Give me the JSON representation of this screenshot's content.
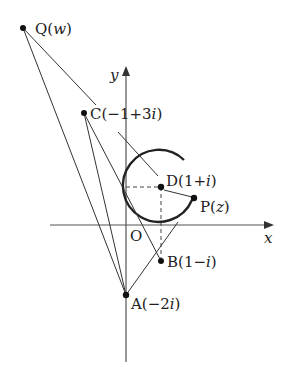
{
  "diagram": {
    "type": "complex-plane-geometry",
    "axes": {
      "x_label": "x",
      "y_label": "y",
      "origin_label": "O"
    },
    "points": {
      "Q": {
        "name": "Q",
        "arg": "w",
        "label_open": "Q(",
        "label_var": "w",
        "label_close": ")"
      },
      "C": {
        "name": "C",
        "label_open": "C(−1+3",
        "label_var": "i",
        "label_close": ")",
        "value": "-1+3i"
      },
      "D": {
        "name": "D",
        "label_open": "D(1+",
        "label_var": "i",
        "label_close": ")",
        "value": "1+i"
      },
      "P": {
        "name": "P",
        "label_open": "P(",
        "label_var": "z",
        "label_close": ")"
      },
      "B": {
        "name": "B",
        "label_open": "B(1−",
        "label_var": "i",
        "label_close": ")",
        "value": "1-i"
      },
      "A": {
        "name": "A",
        "label_open": "A(−2",
        "label_var": "i",
        "label_close": ")",
        "value": "-2i"
      }
    },
    "circle": {
      "center": "D",
      "radius": 1
    },
    "colors": {
      "stroke": "#333333",
      "text": "#222222",
      "background": "#ffffff"
    }
  }
}
